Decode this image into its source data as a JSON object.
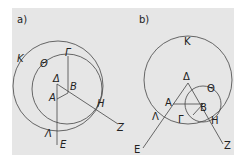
{
  "figure": {
    "background": "#e6e6e6",
    "stroke_color": "#444444",
    "panels": [
      {
        "id": "a",
        "label": "a)",
        "points": {
          "K": "K",
          "Theta": "Θ",
          "Gamma": "Γ",
          "Delta": "Δ",
          "A": "A",
          "B": "B",
          "H": "H",
          "Z": "Z",
          "Lambda": "Λ",
          "E": "E"
        }
      },
      {
        "id": "b",
        "label": "b)",
        "points": {
          "K": "K",
          "Theta": "Θ",
          "Gamma": "Γ",
          "Delta": "Δ",
          "A": "A",
          "B": "B",
          "H": "H",
          "Z": "Z",
          "Lambda": "Λ",
          "E": "E"
        }
      }
    ]
  }
}
